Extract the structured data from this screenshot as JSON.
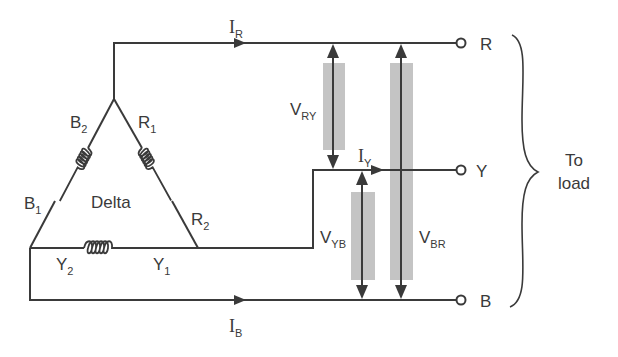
{
  "diagram": {
    "type": "delta-connected three-phase source to load",
    "center_label": "Delta",
    "windings": [
      {
        "name": "B",
        "ends": [
          {
            "letter": "B",
            "index": "1"
          },
          {
            "letter": "B",
            "index": "2"
          }
        ]
      },
      {
        "name": "R",
        "ends": [
          {
            "letter": "R",
            "index": "1"
          },
          {
            "letter": "R",
            "index": "2"
          }
        ]
      },
      {
        "name": "Y",
        "ends": [
          {
            "letter": "Y",
            "index": "1"
          },
          {
            "letter": "Y",
            "index": "2"
          }
        ]
      }
    ],
    "line_currents": [
      {
        "letter": "I",
        "sub": "R"
      },
      {
        "letter": "I",
        "sub": "Y"
      },
      {
        "letter": "I",
        "sub": "B"
      }
    ],
    "line_voltages": [
      {
        "letter": "V",
        "sub": "RY"
      },
      {
        "letter": "V",
        "sub": "YB"
      },
      {
        "letter": "V",
        "sub": "BR"
      }
    ],
    "terminals": [
      "R",
      "Y",
      "B"
    ],
    "load_label_line1": "To",
    "load_label_line2": "load",
    "colors": {
      "ink": "#3a3a3a",
      "band": "#c4c4c4",
      "background": "#ffffff"
    }
  }
}
